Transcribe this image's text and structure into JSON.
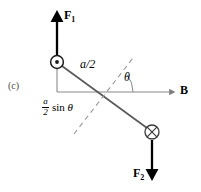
{
  "figure": {
    "panel_letter": "(c)",
    "width_px": 201,
    "height_px": 192
  },
  "labels": {
    "force_up": "F",
    "force_up_sub": "1",
    "force_down": "F",
    "force_down_sub": "2",
    "field": "B",
    "half_length": "a/2",
    "angle": "θ",
    "moment_arm_numerator": "a",
    "moment_arm_denominator": "2",
    "moment_arm_function": "sin",
    "moment_arm_angle": "θ"
  },
  "markers": {
    "out_of_page_symbol": "circle-dot",
    "into_page_symbol": "circle-cross"
  },
  "colors": {
    "ink": "#000000",
    "rod": "#555555",
    "axis": "#808080",
    "dashed": "#9a9a9a",
    "panel_letter": "#4a4a4a",
    "background": "#ffffff"
  },
  "geometry": {
    "pivot_x": 105,
    "pivot_y": 92,
    "out_of_page_center": [
      57,
      62
    ],
    "into_page_center": [
      152,
      132
    ],
    "b_arrow_tip_x": 175,
    "f1_arrow_tip_y": 13,
    "f2_arrow_tip_y": 179,
    "angle_degrees": 37
  }
}
